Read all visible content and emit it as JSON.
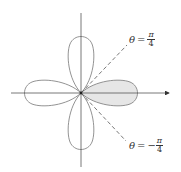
{
  "diagram": {
    "type": "polar-rose",
    "colors": {
      "curve": "#666666",
      "axis": "#555555",
      "shade": "#e6e6e6",
      "dashed": "#555555"
    },
    "labels": {
      "upper": {
        "theta": "θ",
        "eq": "=",
        "sign": "",
        "num": "π",
        "den": "4"
      },
      "lower": {
        "theta": "θ",
        "eq": "=",
        "sign": "−",
        "num": "π",
        "den": "4"
      }
    }
  }
}
